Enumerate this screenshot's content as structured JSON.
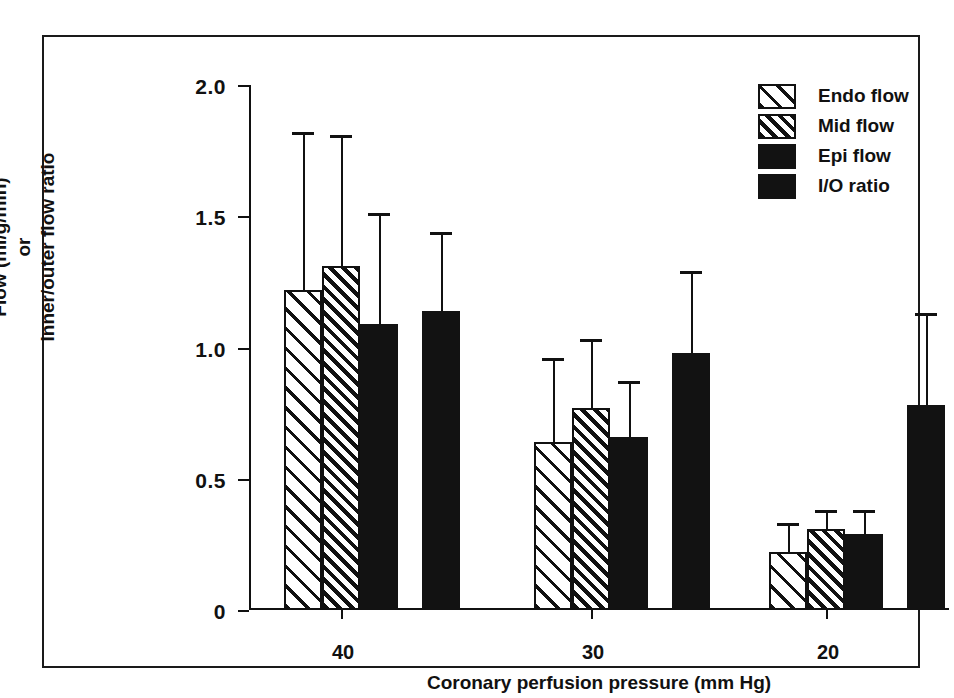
{
  "chart_data": {
    "type": "bar",
    "title": "",
    "xlabel": "Coronary perfusion pressure (mm Hg)",
    "ylabel_lines": [
      "Flow (ml/g/min)",
      "or",
      "Inner/outer flow ratio"
    ],
    "ylabel": "Flow (ml/g/min) or Inner/outer flow ratio",
    "categories": [
      "40",
      "30",
      "20"
    ],
    "ylim": [
      0,
      2.0
    ],
    "yticks": [
      "0",
      "0.5",
      "1.0",
      "1.5",
      "2.0"
    ],
    "ytick_values": [
      0,
      0.5,
      1.0,
      1.5,
      2.0
    ],
    "grid": false,
    "legend_position": "top-right",
    "series": [
      {
        "name": "Endo flow",
        "fill": "sparse-diagonal-hatch",
        "values": [
          1.22,
          0.64,
          0.22
        ],
        "errors_upper": [
          1.81,
          0.95,
          0.32
        ]
      },
      {
        "name": "Mid flow",
        "fill": "dense-diagonal-hatch",
        "values": [
          1.31,
          0.77,
          0.31
        ],
        "errors_upper": [
          1.8,
          1.02,
          0.37
        ]
      },
      {
        "name": "Epi flow",
        "fill": "solid-black",
        "values": [
          1.09,
          0.66,
          0.29
        ],
        "errors_upper": [
          1.5,
          0.86,
          0.37
        ]
      },
      {
        "name": "I/O ratio",
        "fill": "solid-black",
        "values": [
          1.14,
          0.98,
          0.78
        ],
        "errors_upper": [
          1.43,
          1.28,
          1.12
        ]
      }
    ]
  },
  "legend": {
    "items": [
      {
        "label": "Endo flow",
        "fill": "endo"
      },
      {
        "label": "Mid flow",
        "fill": "mid"
      },
      {
        "label": "Epi flow",
        "fill": "epi"
      },
      {
        "label": "I/O ratio",
        "fill": "io"
      }
    ]
  },
  "colors": {
    "ink": "#111111",
    "background": "#ffffff",
    "bar_solid": "#121212"
  }
}
